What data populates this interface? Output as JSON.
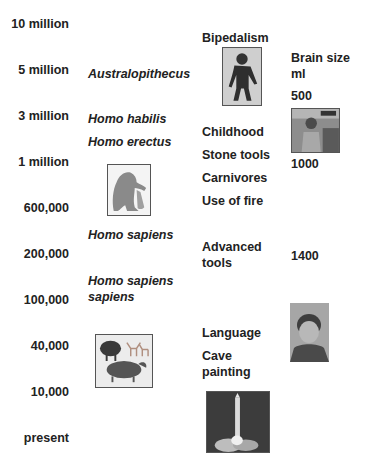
{
  "timeline": {
    "labels": [
      "10 million",
      "5 million",
      "3 million",
      "1 million",
      "600,000",
      "200,000",
      "100,000",
      "40,000",
      "10,000",
      "present"
    ]
  },
  "species": {
    "items": [
      "Australopithecus",
      "Homo habilis",
      "Homo erectus",
      "Homo sapiens",
      "Homo sapiens sapiens"
    ]
  },
  "developments": {
    "items": [
      "Bipedalism",
      "Childhood",
      "Stone tools",
      "Carnivores",
      "Use of fire",
      "Advanced tools",
      "Language",
      "Cave painting"
    ]
  },
  "brain": {
    "header": "Brain size ml",
    "values": [
      "500",
      "1000",
      "1400"
    ]
  },
  "images": {
    "ape": "standing-hominid-photo",
    "toolmaker": "crouching-toolmaker-drawing",
    "cave": "cave-painting-animals",
    "rocket": "rocket-launch-photo",
    "child": "child-photo",
    "boy": "boy-portrait-photo"
  }
}
